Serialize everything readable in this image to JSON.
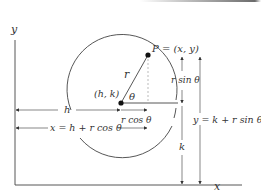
{
  "diagram": {
    "axes": {
      "x_label": "x",
      "y_label": "y"
    },
    "points": {
      "P_label": "P = (x, y)",
      "center_label": "(h, k)"
    },
    "labels": {
      "radius": "r",
      "angle": "θ",
      "r_sin": "r sin θ",
      "r_cos": "r cos θ",
      "h": "h",
      "k": "k",
      "x_eq": "x = h + r cos θ",
      "y_eq": "y = k + r sin θ"
    },
    "colors": {
      "ink": "#333333",
      "dashed": "#999999",
      "background": "#ffffff"
    }
  }
}
